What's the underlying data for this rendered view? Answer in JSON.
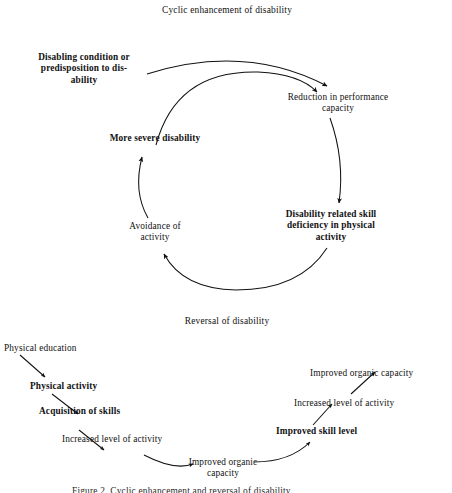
{
  "document": {
    "background_color": "#ffffff",
    "ink_color": "#111111"
  },
  "diagrams": [
    {
      "id": "cyclic-enhancement",
      "title": "Cyclic enhancement of disability",
      "nodes": [
        {
          "id": "disabling-condition",
          "label": "Disabling condition or\npredisposition to dis-\nability",
          "bold": true
        },
        {
          "id": "reduction-performance",
          "label": "Reduction in performance\ncapacity",
          "bold": false
        },
        {
          "id": "skill-deficiency",
          "label": "Disability related skill\ndeficiency in physical\nactivity",
          "bold": true
        },
        {
          "id": "avoidance-activity",
          "label": "Avoidance of\nactivity",
          "bold": false
        },
        {
          "id": "more-severe-disability",
          "label": "More severe disability",
          "bold": true
        }
      ]
    },
    {
      "id": "reversal-of-disability",
      "title": "Reversal of disability",
      "nodes": [
        {
          "id": "physical-education",
          "label": "Physical education",
          "bold": false
        },
        {
          "id": "physical-activity",
          "label": "Physical activity",
          "bold": true
        },
        {
          "id": "acquisition-of-skills",
          "label": "Acquisition of skills",
          "bold": true
        },
        {
          "id": "increased-level-activity-left",
          "label": "Increased level of activity",
          "bold": false
        },
        {
          "id": "improved-organic-capacity-mid",
          "label": "Improved organic\ncapacity",
          "bold": false
        },
        {
          "id": "improved-skill-level",
          "label": "Improved skill level",
          "bold": true
        },
        {
          "id": "increased-level-activity-right",
          "label": "Increased level of activity",
          "bold": false
        },
        {
          "id": "improved-organic-capacity-top",
          "label": "Improved organic capacity",
          "bold": false
        }
      ]
    }
  ],
  "caption": {
    "text": "Figure 2. Cyclic enhancement and reversal of disability."
  }
}
